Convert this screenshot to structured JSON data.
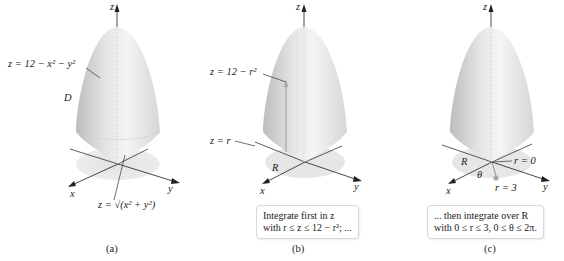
{
  "figure": {
    "panels": [
      {
        "id": "a",
        "caption": "(a)",
        "labels": {
          "z_axis": "z",
          "x_axis": "x",
          "y_axis": "y",
          "upper_surface": "z = 12 − x² − y²",
          "region": "D",
          "lower_surface": "z = √(x² + y²)"
        }
      },
      {
        "id": "b",
        "caption": "(b)",
        "labels": {
          "z_axis": "z",
          "x_axis": "x",
          "y_axis": "y",
          "upper_surface": "z = 12 − r²",
          "lower_surface": "z = r",
          "region": "R"
        },
        "note": {
          "line1": "Integrate first in z",
          "line2": "with r ≤ z ≤ 12 − r²; ..."
        }
      },
      {
        "id": "c",
        "caption": "(c)",
        "labels": {
          "z_axis": "z",
          "x_axis": "x",
          "y_axis": "y",
          "region": "R",
          "theta": "θ",
          "r_inner": "r = 0",
          "r_outer": "r = 3"
        },
        "note": {
          "line1": "... then integrate over R",
          "line2": "with 0 ≤ r ≤ 3, 0 ≤ θ ≤ 2π."
        }
      }
    ],
    "colors": {
      "surface_light": "#f4f4f4",
      "surface_mid": "#dcdcdc",
      "surface_dark": "#bdbdbd",
      "region_shadow": "#e6e6e6",
      "axis": "#333333",
      "arrow_point": "#a9a9a9"
    }
  }
}
